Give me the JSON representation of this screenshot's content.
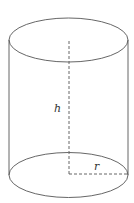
{
  "diagram": {
    "shape": "cylinder",
    "labels": {
      "height": "h",
      "radius": "r"
    },
    "stroke_color": "#555555",
    "background": "#ffffff"
  }
}
